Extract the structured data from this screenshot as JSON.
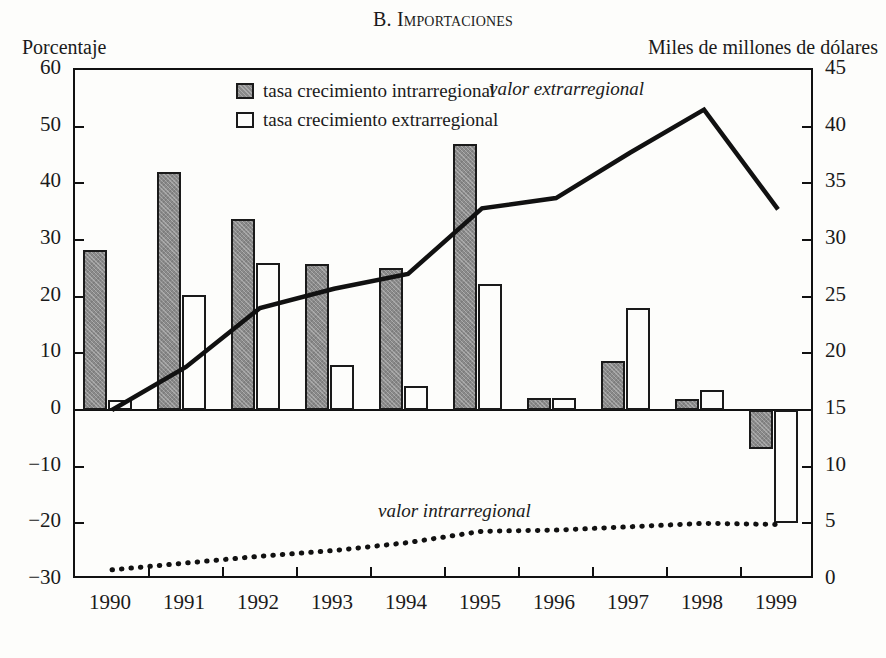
{
  "chart_data": {
    "type": "bar",
    "title": "B. Importaciones",
    "title_prefix": "B. ",
    "title_main": "Importaciones",
    "xlabel": "",
    "ylabel": "Porcentaje",
    "y2label": "Miles de millones de dólares",
    "categories": [
      "1990",
      "1991",
      "1992",
      "1993",
      "1994",
      "1995",
      "1996",
      "1997",
      "1998",
      "1999"
    ],
    "ylim": [
      -30,
      60
    ],
    "yticks": [
      60,
      50,
      40,
      30,
      20,
      10,
      0,
      -10,
      -20,
      -30
    ],
    "ytick_labels": [
      "60",
      "50",
      "40",
      "30",
      "20",
      "10",
      "0",
      "−10",
      "−20",
      "−30"
    ],
    "y2lim": [
      0,
      45
    ],
    "y2ticks": [
      45,
      40,
      35,
      30,
      25,
      20,
      15,
      10,
      5,
      0
    ],
    "y2tick_labels": [
      "45",
      "40",
      "35",
      "30",
      "25",
      "20",
      "15",
      "10",
      "5",
      "0"
    ],
    "grid": false,
    "legend_position": "top-center",
    "series": [
      {
        "name": "tasa crecimiento intrarregional",
        "kind": "bar",
        "axis": "left",
        "color": "#8a8a8a",
        "values": [
          28.3,
          42.0,
          33.7,
          25.7,
          25.0,
          47.0,
          2.1,
          8.6,
          2.0,
          -6.8
        ]
      },
      {
        "name": "tasa crecimiento extrarregional",
        "kind": "bar",
        "axis": "left",
        "color": "#ffffff",
        "values": [
          1.8,
          20.3,
          26.0,
          8.0,
          4.3,
          22.2,
          2.1,
          18.0,
          3.5,
          -20.0
        ]
      },
      {
        "name": "valor extrarregional",
        "kind": "line",
        "axis": "right",
        "style": "solid",
        "color": "#111111",
        "values": [
          15.0,
          18.8,
          24.0,
          25.7,
          27.0,
          32.8,
          33.7,
          37.7,
          41.5,
          32.7
        ]
      },
      {
        "name": "valor intrarregional",
        "kind": "line",
        "axis": "right",
        "style": "dotted",
        "color": "#111111",
        "values": [
          0.9,
          1.5,
          2.1,
          2.6,
          3.3,
          4.3,
          4.4,
          4.7,
          5.0,
          4.9
        ]
      }
    ],
    "annotations": [
      {
        "id": "valor-extrarregional",
        "text": "valor extrarregional"
      },
      {
        "id": "valor-intrarregional",
        "text": "valor intrarregional"
      }
    ],
    "legend": [
      {
        "key": "intra",
        "label": "tasa crecimiento intrarregional"
      },
      {
        "key": "extra",
        "label": "tasa crecimiento extrarregional"
      }
    ]
  }
}
